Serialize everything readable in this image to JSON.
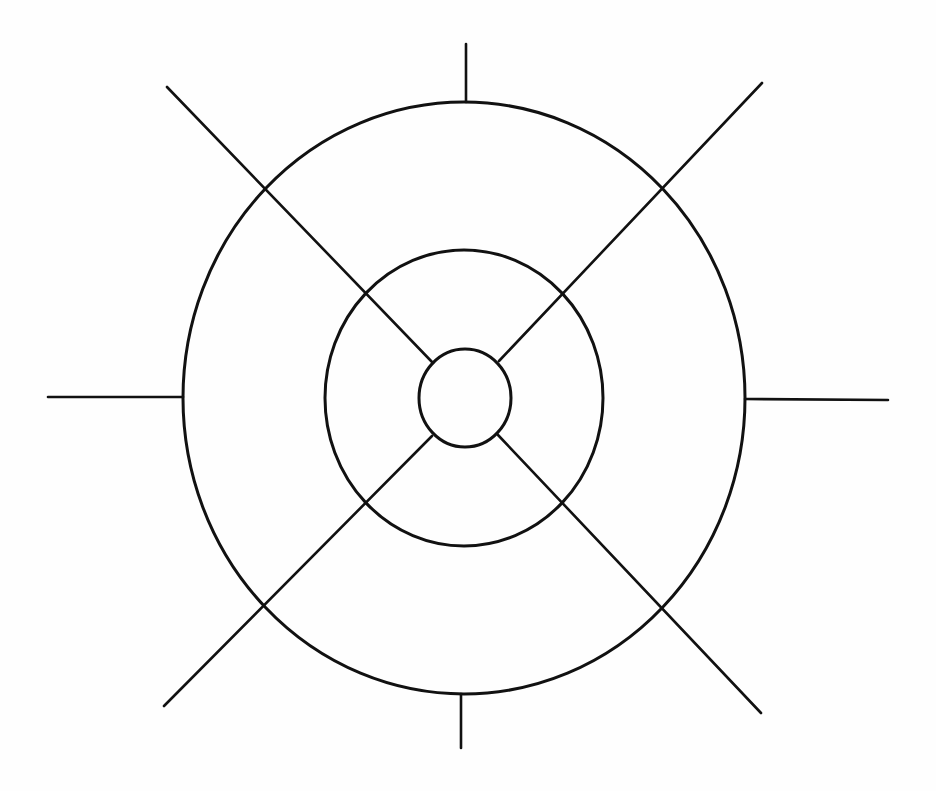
{
  "diagram": {
    "title": "",
    "stroke_color": "#111111",
    "background_color": "#ffffff",
    "center": {
      "x": 465,
      "y": 398
    },
    "rings": [
      {
        "name": "inner-circle",
        "cx": 465,
        "cy": 398,
        "rx": 46,
        "ry": 49,
        "stroke_width": 3
      },
      {
        "name": "middle-ring",
        "cx": 464,
        "cy": 398,
        "rx": 139,
        "ry": 148,
        "stroke_width": 3
      },
      {
        "name": "outer-ring",
        "cx": 464,
        "cy": 398,
        "rx": 281,
        "ry": 296,
        "stroke_width": 3
      }
    ],
    "axis_ticks": [
      {
        "name": "tick-top",
        "x1": 466,
        "y1": 44,
        "x2": 466,
        "y2": 102
      },
      {
        "name": "tick-bottom",
        "x1": 461,
        "y1": 694,
        "x2": 461,
        "y2": 748
      },
      {
        "name": "tick-left",
        "x1": 48,
        "y1": 397,
        "x2": 183,
        "y2": 397
      },
      {
        "name": "tick-right",
        "x1": 745,
        "y1": 399,
        "x2": 888,
        "y2": 400
      }
    ],
    "diagonal_spokes": [
      {
        "name": "spoke-upper-left",
        "x1": 167,
        "y1": 87,
        "x2": 433,
        "y2": 363
      },
      {
        "name": "spoke-upper-right",
        "x1": 762,
        "y1": 83,
        "x2": 499,
        "y2": 361
      },
      {
        "name": "spoke-lower-left",
        "x1": 164,
        "y1": 706,
        "x2": 432,
        "y2": 436
      },
      {
        "name": "spoke-lower-right",
        "x1": 761,
        "y1": 713,
        "x2": 498,
        "y2": 435
      }
    ],
    "intersection_points": [
      {
        "x": 263,
        "y": 190
      },
      {
        "x": 661,
        "y": 188
      },
      {
        "x": 263,
        "y": 606
      },
      {
        "x": 660,
        "y": 608
      },
      {
        "x": 368,
        "y": 294
      },
      {
        "x": 564,
        "y": 296
      },
      {
        "x": 368,
        "y": 502
      },
      {
        "x": 564,
        "y": 505
      }
    ],
    "labels": []
  }
}
